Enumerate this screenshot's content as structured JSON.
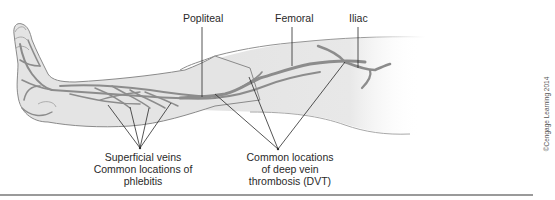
{
  "figure": {
    "colors": {
      "skin_fill": "#e6e6e6",
      "skin_outline": "#8a8a8a",
      "vein": "#8c8c8c",
      "leader_line": "#2a2a2a",
      "text": "#2a2a2a"
    },
    "vein_labels": {
      "popliteal": "Popliteal",
      "femoral": "Femoral",
      "iliac": "Iliac"
    },
    "captions": {
      "superficial": {
        "lines": [
          "Superficial veins",
          "Common locations of",
          "phlebitis"
        ]
      },
      "dvt": {
        "lines": [
          "Common locations",
          "of deep vein",
          "thrombosis (DVT)"
        ]
      }
    },
    "copyright": "©Cengage Learning 2014"
  }
}
